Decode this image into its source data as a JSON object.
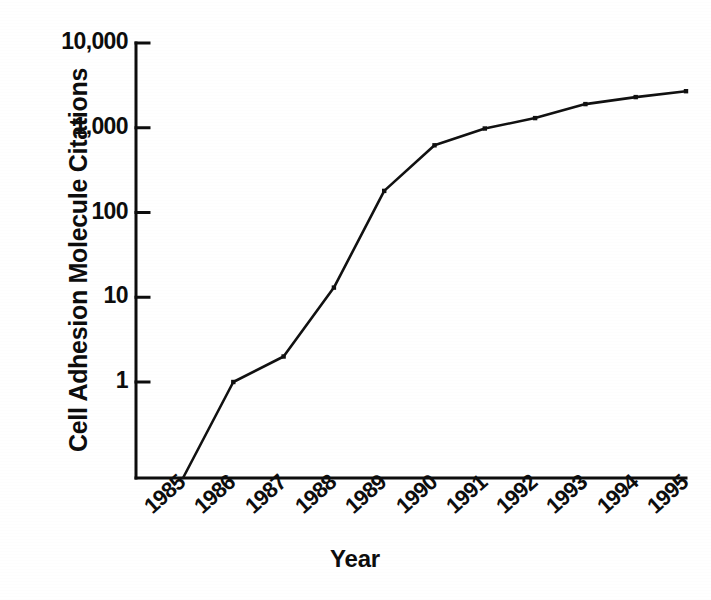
{
  "chart_data": {
    "type": "line",
    "title": "",
    "xlabel": "Year",
    "ylabel": "Cell Adhesion Molecule Citations",
    "yscale": "log",
    "ylim": [
      1,
      10000
    ],
    "y_ticks": [
      "1",
      "10",
      "100",
      "1,000",
      "10,000"
    ],
    "y_tick_values": [
      1,
      10,
      100,
      1000,
      10000
    ],
    "categories": [
      "1985",
      "1986",
      "1987",
      "1988",
      "1989",
      "1990",
      "1991",
      "1992",
      "1993",
      "1994",
      "1995"
    ],
    "x": [
      1985,
      1986,
      1987,
      1988,
      1989,
      1990,
      1991,
      1992,
      1993,
      1994,
      1995
    ],
    "values": [
      0,
      1,
      2,
      13,
      180,
      620,
      980,
      1300,
      1900,
      2300,
      2700
    ],
    "series": [
      {
        "name": "Cell Adhesion Molecule Citations",
        "values": [
          0,
          1,
          2,
          13,
          180,
          620,
          980,
          1300,
          1900,
          2300,
          2700
        ]
      }
    ],
    "grid": false,
    "legend": false,
    "legend_position": "none",
    "marker": "square",
    "line_color": "#111111",
    "background_color": "#ffffff",
    "annotations": []
  },
  "axis_titles": {
    "y": "Cell Adhesion Molecule Citations",
    "x": "Year"
  },
  "colors": {
    "ink": "#0d0d0d",
    "line": "#111111",
    "paper": "#ffffff"
  }
}
